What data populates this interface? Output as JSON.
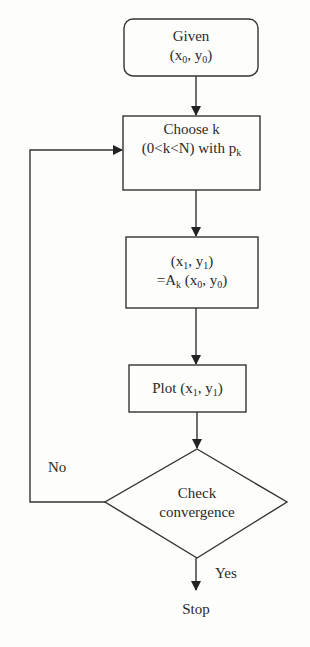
{
  "diagram": {
    "type": "flowchart",
    "nodes": [
      {
        "id": "given",
        "shape": "rounded-rect",
        "line1": "Given",
        "line2_main": "(x",
        "line2_sub1": "0",
        "line2_mid": ", y",
        "line2_sub2": "0",
        "line2_end": ")"
      },
      {
        "id": "choose",
        "shape": "rect",
        "line1": "Choose k",
        "line2_main": "(0<k<N) with p",
        "line2_sub": "k"
      },
      {
        "id": "apply",
        "shape": "rect",
        "line1_a": "(x",
        "line1_s1": "1",
        "line1_b": ", y",
        "line1_s2": "1",
        "line1_c": ")",
        "line2_a": "=A",
        "line2_s1": "k",
        "line2_b": " (x",
        "line2_s2": "0",
        "line2_c": ", y",
        "line2_s3": "0",
        "line2_d": ")"
      },
      {
        "id": "plot",
        "shape": "rect",
        "a": "Plot (x",
        "s1": "1",
        "b": ", y",
        "s2": "1",
        "c": ")"
      },
      {
        "id": "check",
        "shape": "diamond",
        "line1": "Check",
        "line2": "convergence"
      },
      {
        "id": "stop",
        "shape": "text",
        "label": "Stop"
      }
    ],
    "edges": [
      {
        "from": "given",
        "to": "choose"
      },
      {
        "from": "choose",
        "to": "apply"
      },
      {
        "from": "apply",
        "to": "plot"
      },
      {
        "from": "plot",
        "to": "check"
      },
      {
        "from": "check",
        "to": "choose",
        "label": "No"
      },
      {
        "from": "check",
        "to": "stop",
        "label": "Yes"
      }
    ],
    "labels": {
      "no": "No",
      "yes": "Yes"
    }
  }
}
